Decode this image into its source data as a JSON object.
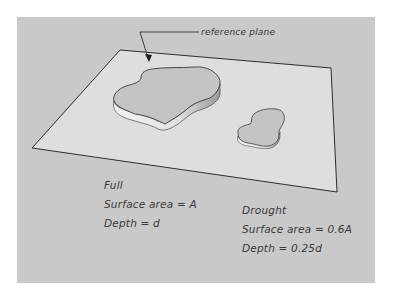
{
  "diagram": {
    "callout": {
      "label": "reference plane"
    },
    "full": {
      "title": "Full",
      "surface_area": "Surface area = A",
      "depth": "Depth = d"
    },
    "drought": {
      "title": "Drought",
      "surface_area": "Surface area = 0.6A",
      "depth": "Depth = 0.25d"
    },
    "colors": {
      "background": "#c9c9c9",
      "plane": "#dedede",
      "pond_top": "#c4c4c4",
      "outline": "#3a3a3a"
    }
  }
}
